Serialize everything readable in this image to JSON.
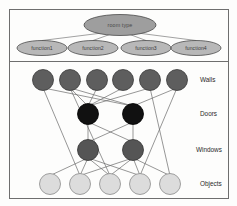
{
  "figure": {
    "title": "",
    "frame": {
      "border_color": "#6e6e6e",
      "background": "#fdfdfc"
    }
  },
  "chart_data": {
    "type": "diagram",
    "title": "",
    "panels": [
      {
        "name": "function-panel",
        "nodes": [
          {
            "id": "root",
            "label": "room type",
            "shape": "ellipse",
            "cx": 120,
            "cy": 25,
            "rx": 36,
            "ry": 10.5,
            "fill": "#9e9e9e",
            "stroke": "#4a4a4a"
          },
          {
            "id": "f1",
            "label": "function1",
            "shape": "ellipse",
            "cx": 42,
            "cy": 48,
            "rx": 25,
            "ry": 7.5,
            "fill": "#b8b8b8",
            "stroke": "#4a4a4a"
          },
          {
            "id": "f2",
            "label": "function2",
            "shape": "ellipse",
            "cx": 93,
            "cy": 48,
            "rx": 25,
            "ry": 7.5,
            "fill": "#b8b8b8",
            "stroke": "#4a4a4a"
          },
          {
            "id": "f3",
            "label": "function3",
            "shape": "ellipse",
            "cx": 146,
            "cy": 48,
            "rx": 25,
            "ry": 7.5,
            "fill": "#b8b8b8",
            "stroke": "#4a4a4a"
          },
          {
            "id": "f4",
            "label": "function4",
            "shape": "ellipse",
            "cx": 196,
            "cy": 48,
            "rx": 25,
            "ry": 7.5,
            "fill": "#b8b8b8",
            "stroke": "#4a4a4a"
          }
        ],
        "edges": [
          [
            "root",
            "f1"
          ],
          [
            "root",
            "f2"
          ],
          [
            "root",
            "f3"
          ],
          [
            "root",
            "f4"
          ]
        ]
      },
      {
        "name": "network-panel",
        "rows": [
          {
            "label": "Walls",
            "fill": "#5e5e5e",
            "stroke": "#3a3a3a",
            "r": 10.5,
            "cy": 80,
            "label_x": 200,
            "nodes_x": [
              43,
              70,
              97,
              123,
              150,
              177
            ]
          },
          {
            "label": "Doors",
            "fill": "#111111",
            "stroke": "#000000",
            "r": 10.5,
            "cy": 114,
            "label_x": 200,
            "nodes_x": [
              88,
              133
            ]
          },
          {
            "label": "Windows",
            "fill": "#555555",
            "stroke": "#333333",
            "r": 10.5,
            "cy": 150,
            "label_x": 196,
            "nodes_x": [
              88,
              133
            ]
          },
          {
            "label": "Objects",
            "fill": "#dcdcdc",
            "stroke": "#8a8a8a",
            "r": 10.5,
            "cy": 184,
            "label_x": 200,
            "nodes_x": [
              50,
              80,
              110,
              140,
              170
            ]
          }
        ],
        "edges_walls_to_doors": [
          [
            43,
            133
          ],
          [
            70,
            88
          ],
          [
            70,
            133
          ],
          [
            97,
            88
          ],
          [
            123,
            88
          ],
          [
            150,
            88
          ],
          [
            177,
            133
          ]
        ],
        "edges_doors_to_windows": [
          [
            88,
            88
          ],
          [
            88,
            133
          ],
          [
            133,
            88
          ],
          [
            133,
            133
          ]
        ],
        "edges_windows_to_objects": [
          [
            88,
            50
          ],
          [
            88,
            80
          ],
          [
            88,
            110
          ],
          [
            88,
            140
          ],
          [
            133,
            80
          ],
          [
            133,
            110
          ],
          [
            133,
            140
          ],
          [
            133,
            170
          ]
        ],
        "edges_walls_to_objects": [
          [
            43,
            80
          ],
          [
            70,
            110
          ],
          [
            150,
            170
          ],
          [
            177,
            140
          ]
        ]
      }
    ]
  }
}
